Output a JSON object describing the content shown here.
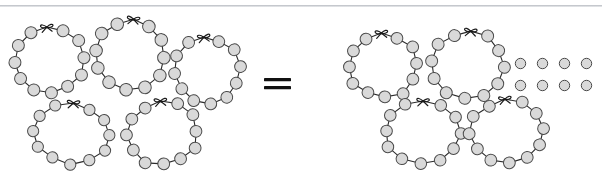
{
  "page": {
    "background_color": "#ffffff",
    "width": 602,
    "height": 176,
    "top_rule_color": "#b9bcc2"
  },
  "style": {
    "bead_fill": "#d9d9d9",
    "bead_stroke": "#4a4a4a",
    "string_stroke": "#2b2b2b",
    "bow_stroke": "#1a1a1a",
    "equals_color": "#111111"
  },
  "equals": {
    "symbol": "=",
    "name": "equals-sign"
  },
  "left_group": {
    "label": "left side of equation",
    "necklace_count": 5,
    "beads_per_necklace": 11,
    "total_beads": 55,
    "necklaces": [
      {
        "id": "left-necklace-1",
        "beads": 11,
        "x": 6,
        "y": 16,
        "w": 86,
        "h": 84,
        "rotate": -4
      },
      {
        "id": "left-necklace-2",
        "beads": 11,
        "x": 86,
        "y": 8,
        "w": 88,
        "h": 88,
        "rotate": 6
      },
      {
        "id": "left-necklace-3",
        "beads": 11,
        "x": 166,
        "y": 26,
        "w": 82,
        "h": 84,
        "rotate": -6
      },
      {
        "id": "left-necklace-4",
        "beads": 11,
        "x": 26,
        "y": 92,
        "w": 92,
        "h": 78,
        "rotate": 3
      },
      {
        "id": "left-necklace-5",
        "beads": 11,
        "x": 118,
        "y": 90,
        "w": 88,
        "h": 82,
        "rotate": -3
      }
    ]
  },
  "right_group": {
    "label": "right side of equation",
    "necklace_count": 4,
    "beads_per_necklace": 11,
    "necklace_beads_total": 44,
    "loose_bead_count": 10,
    "loose_bead_rows": 2,
    "loose_beads_per_row": 5,
    "total_beads": 54,
    "necklaces": [
      {
        "id": "right-necklace-1",
        "beads": 11,
        "x": 40,
        "y": 22,
        "w": 86,
        "h": 82,
        "rotate": -3
      },
      {
        "id": "right-necklace-2",
        "beads": 11,
        "x": 124,
        "y": 20,
        "w": 88,
        "h": 84,
        "rotate": 5
      },
      {
        "id": "right-necklace-3",
        "beads": 11,
        "x": 76,
        "y": 90,
        "w": 92,
        "h": 80,
        "rotate": 2
      },
      {
        "id": "right-necklace-4",
        "beads": 11,
        "x": 162,
        "y": 88,
        "w": 90,
        "h": 82,
        "rotate": -4
      }
    ],
    "loose_beads": {
      "rows": [
        [
          "bead",
          "bead",
          "bead",
          "bead",
          "bead"
        ],
        [
          "bead",
          "bead",
          "bead",
          "bead",
          "bead"
        ]
      ]
    }
  }
}
